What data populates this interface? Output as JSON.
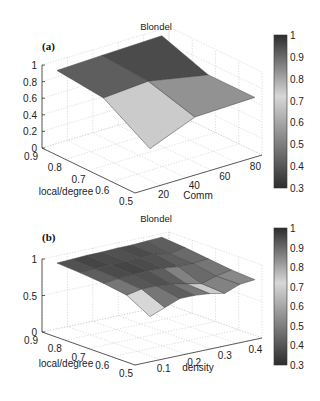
{
  "chart_data": [
    {
      "panel_label": "(a)",
      "type": "surface3d",
      "title": "Blondel",
      "xlabel": "Comm",
      "ylabel": "local/degree",
      "zlabel": "",
      "x_ticks": [
        "20",
        "40",
        "60",
        "80"
      ],
      "y_ticks": [
        "0.9",
        "0.8",
        "0.7",
        "0.6",
        "0.5"
      ],
      "z_ticks": [
        "0",
        "0.2",
        "0.4",
        "0.6",
        "0.8",
        "1"
      ],
      "zlim": [
        0,
        1
      ],
      "colorbar": {
        "ticks": [
          "1",
          "0.9",
          "0.8",
          "0.7",
          "0.6",
          "0.5",
          "0.4",
          "0.3"
        ],
        "range": [
          0.3,
          1
        ]
      },
      "grid": true,
      "x": [
        10,
        40,
        80
      ],
      "y": [
        0.9,
        0.7,
        0.5
      ],
      "z": [
        [
          0.88,
          0.9,
          0.92
        ],
        [
          0.82,
          0.86,
          0.72
        ],
        [
          0.48,
          0.7,
          0.72
        ]
      ],
      "face_values": [
        [
          0.92,
          0.95
        ],
        [
          0.74,
          0.55
        ]
      ]
    },
    {
      "panel_label": "(b)",
      "type": "surface3d",
      "title": "Blondel",
      "xlabel": "density",
      "ylabel": "local/degree",
      "zlabel": "",
      "x_ticks": [
        "0.1",
        "0.2",
        "0.3",
        "0.4"
      ],
      "y_ticks": [
        "0.9",
        "0.8",
        "0.7",
        "0.6",
        "0.5"
      ],
      "z_ticks": [
        "0",
        "0.5",
        "1"
      ],
      "zlim": [
        0,
        1
      ],
      "colorbar": {
        "ticks": [
          "1",
          "0.9",
          "0.8",
          "0.7",
          "0.6",
          "0.5",
          "0.4",
          "0.3"
        ],
        "range": [
          0.3,
          1
        ]
      },
      "grid": true,
      "x": [
        0.05,
        0.1,
        0.15,
        0.2,
        0.25,
        0.3,
        0.35,
        0.4
      ],
      "y": [
        0.9,
        0.8,
        0.7,
        0.6,
        0.5
      ],
      "z": [
        [
          0.9,
          0.91,
          0.92,
          0.92,
          0.93,
          0.93,
          0.94,
          0.95
        ],
        [
          0.88,
          0.89,
          0.9,
          0.91,
          0.91,
          0.92,
          0.88,
          0.92
        ],
        [
          0.85,
          0.87,
          0.88,
          0.89,
          0.88,
          0.86,
          0.86,
          0.88
        ],
        [
          0.8,
          0.84,
          0.84,
          0.82,
          0.78,
          0.74,
          0.8,
          0.84
        ],
        [
          0.62,
          0.7,
          0.78,
          0.78,
          0.76,
          0.72,
          0.8,
          0.82
        ]
      ],
      "face_values": [
        [
          0.94,
          0.96,
          0.95,
          0.94,
          0.95,
          0.93,
          0.92
        ],
        [
          0.92,
          0.95,
          0.96,
          0.95,
          0.94,
          0.92,
          0.9
        ],
        [
          0.88,
          0.93,
          0.94,
          0.92,
          0.86,
          0.9,
          0.88
        ],
        [
          0.72,
          0.88,
          0.92,
          0.88,
          0.74,
          0.86,
          0.85
        ]
      ]
    }
  ]
}
